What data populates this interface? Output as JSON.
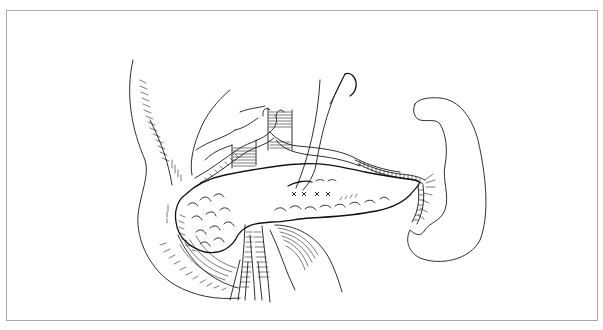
{
  "figure": {
    "kind": "anatomical line illustration",
    "suture_marks": [
      "x",
      "x",
      "x",
      "x"
    ],
    "colors": {
      "ink": "#1a1a1a",
      "frame_border": "#a9a9a9",
      "background": "#ffffff"
    }
  }
}
